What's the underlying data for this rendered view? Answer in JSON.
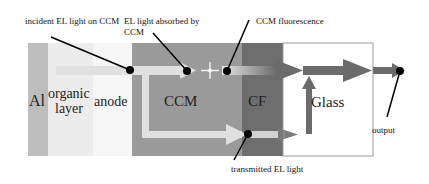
{
  "diagram": {
    "layers": [
      {
        "id": "al",
        "label": "Al",
        "x": 28,
        "width": 20,
        "color": "#bdbdbd"
      },
      {
        "id": "organic",
        "label_line1": "organic",
        "label_line2": "layer",
        "x": 48,
        "width": 45,
        "color": "#ececec"
      },
      {
        "id": "anode",
        "label": "anode",
        "x": 93,
        "width": 39,
        "color": "#f6f6f6"
      },
      {
        "id": "ccm",
        "label": "CCM",
        "x": 132,
        "width": 110,
        "color": "#9a9a9a"
      },
      {
        "id": "cf",
        "label": "CF",
        "x": 242,
        "width": 41,
        "color": "#6e6e6e"
      },
      {
        "id": "glass",
        "label": "Glass",
        "x": 283,
        "width": 90,
        "color": "#ffffff",
        "border": "#8a8a8a"
      }
    ],
    "layer_top": 43,
    "layer_bottom": 156,
    "callouts": {
      "incident": "incident EL light on CCM",
      "absorbed_line1": "EL light absorbed by",
      "absorbed_line2": "CCM",
      "fluorescence": "CCM fluorescence",
      "transmitted": "transmitted EL light",
      "output": "output"
    },
    "colors": {
      "el_light": "#e0e0e0",
      "fluorescence": "#6b6b6b",
      "pointer": "#000000"
    }
  }
}
